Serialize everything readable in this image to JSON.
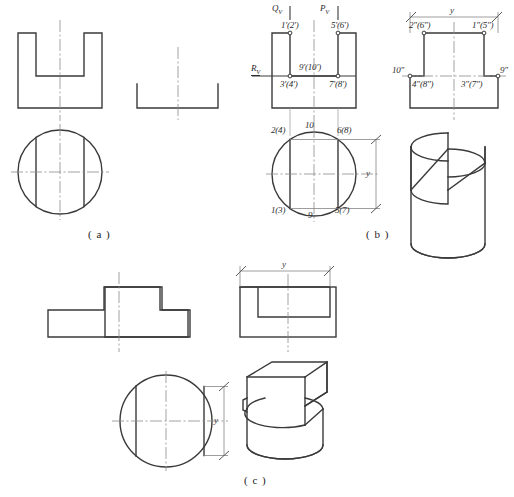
{
  "figure": {
    "background": "#ffffff",
    "line_color": "#3a3a3a",
    "center_line_color": "#8a8a8a",
    "dimension_color": "#7d7d7d"
  },
  "captions": {
    "a": "( a )",
    "b": "( b )",
    "c": "( c )"
  },
  "part_b": {
    "plane_labels": {
      "q": "Q",
      "q_sub": "V",
      "p": "P",
      "p_sub": "V",
      "r": "R",
      "r_sub": "V"
    },
    "front_view_points": {
      "top_left": "1'(2')",
      "top_right": "5'(6')",
      "mid_center": "9'(10')",
      "bottom_left": "3'(4')",
      "bottom_right": "7'(8')"
    },
    "side_view_points": {
      "top_left": "2\"(6\")",
      "top_right": "1\"(5\")",
      "left": "10\"",
      "right": "9\"",
      "bottom_left": "4\"(8\")",
      "bottom_right": "3\"(7\")"
    },
    "top_view_points": {
      "upper_left": "2(4)",
      "upper_mid": "10",
      "upper_right": "6(8)",
      "lower_left": "1(3)",
      "lower_mid": "9",
      "lower_right": "5(7)"
    },
    "dimension_labels": {
      "y_side": "y",
      "y_top": "y"
    }
  },
  "part_c": {
    "dimension_labels": {
      "y_side": "y",
      "y_top": "y"
    }
  }
}
